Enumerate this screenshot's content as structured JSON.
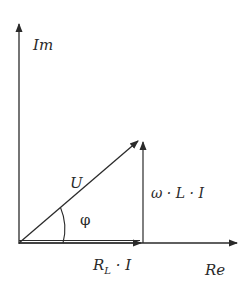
{
  "diagram": {
    "type": "phasor",
    "colors": {
      "stroke": "#2a2a2a",
      "background": "#ffffff"
    },
    "axes": {
      "imaginary_label": "Im",
      "real_label": "Re"
    },
    "vectors": {
      "voltage_label": "U",
      "reactive_label": "ω · L · I",
      "resistive_label_main": "R",
      "resistive_label_sub": "L",
      "resistive_label_rest": " · I"
    },
    "angle_label": "φ"
  }
}
